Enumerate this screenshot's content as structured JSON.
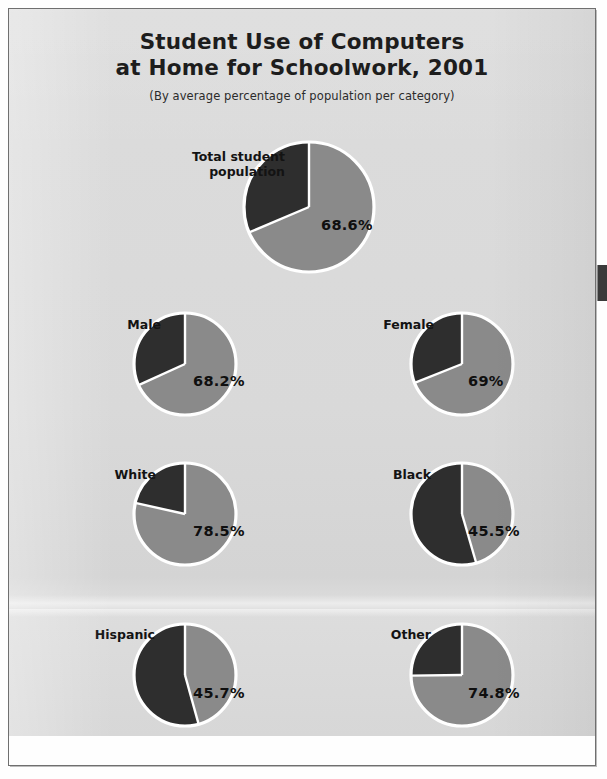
{
  "page": {
    "title_line1": "Student Use of Computers",
    "title_line2": "at Home for Schoolwork, 2001",
    "subtitle": "(By average percentage of population per category)"
  },
  "colors": {
    "panel_background": "#d9d9d9",
    "slice_value": "#8a8a8a",
    "slice_remainder": "#2e2e2e",
    "slice_outline": "#ffffff",
    "text": "#131313",
    "frame": "#6f6f6f"
  },
  "chart_data": {
    "type": "pie",
    "title": "Student Use of Computers at Home for Schoolwork, 2001",
    "subtitle": "(By average percentage of population per category)",
    "xlabel": "",
    "ylabel": "",
    "units": "percent",
    "legend_position": "none",
    "grid": false,
    "series_names": [
      "Uses computer at home for schoolwork",
      "Does not"
    ],
    "slice_colors": [
      "#8a8a8a",
      "#2e2e2e"
    ],
    "start_angle_deg": 0,
    "direction": "clockwise",
    "categories": [
      "Total student population",
      "Male",
      "Female",
      "White",
      "Black",
      "Hispanic",
      "Other"
    ],
    "values": [
      68.6,
      68.2,
      69,
      78.5,
      45.5,
      45.7,
      74.8
    ],
    "pies": [
      {
        "id": "total",
        "label": "Total student population",
        "label_lines": [
          "Total student",
          "population"
        ],
        "value": 68.6,
        "value_label": "68.6%",
        "remainder": 31.4
      },
      {
        "id": "male",
        "label": "Male",
        "label_lines": [
          "Male"
        ],
        "value": 68.2,
        "value_label": "68.2%",
        "remainder": 31.8
      },
      {
        "id": "female",
        "label": "Female",
        "label_lines": [
          "Female"
        ],
        "value": 69,
        "value_label": "69%",
        "remainder": 31
      },
      {
        "id": "white",
        "label": "White",
        "label_lines": [
          "White"
        ],
        "value": 78.5,
        "value_label": "78.5%",
        "remainder": 21.5
      },
      {
        "id": "black",
        "label": "Black",
        "label_lines": [
          "Black"
        ],
        "value": 45.5,
        "value_label": "45.5%",
        "remainder": 54.5
      },
      {
        "id": "hispanic",
        "label": "Hispanic",
        "label_lines": [
          "Hispanic"
        ],
        "value": 45.7,
        "value_label": "45.7%",
        "remainder": 54.3
      },
      {
        "id": "other",
        "label": "Other",
        "label_lines": [
          "Other"
        ],
        "value": 74.8,
        "value_label": "74.8%",
        "remainder": 25.2
      }
    ]
  },
  "layout": {
    "pies": [
      {
        "cx": 300,
        "cy": 198,
        "r": 65,
        "label_x": 158,
        "label_y": 140,
        "label_w": 118,
        "pct_x": 312,
        "pct_y": 208,
        "two_line": true,
        "pct_small": false
      },
      {
        "cx": 176,
        "cy": 355,
        "r": 51,
        "label_x": 60,
        "label_y": 308,
        "label_w": 92,
        "pct_x": 184,
        "pct_y": 364,
        "two_line": false,
        "pct_small": false
      },
      {
        "cx": 453,
        "cy": 355,
        "r": 51,
        "label_x": 333,
        "label_y": 308,
        "label_w": 92,
        "pct_x": 459,
        "pct_y": 364,
        "two_line": false,
        "pct_small": false
      },
      {
        "cx": 176,
        "cy": 505,
        "r": 51,
        "label_x": 55,
        "label_y": 458,
        "label_w": 92,
        "pct_x": 184,
        "pct_y": 514,
        "two_line": false,
        "pct_small": false
      },
      {
        "cx": 453,
        "cy": 505,
        "r": 51,
        "label_x": 330,
        "label_y": 458,
        "label_w": 92,
        "pct_x": 459,
        "pct_y": 514,
        "two_line": false,
        "pct_small": false
      },
      {
        "cx": 176,
        "cy": 666,
        "r": 51,
        "label_x": 42,
        "label_y": 618,
        "label_w": 104,
        "pct_x": 184,
        "pct_y": 676,
        "two_line": false,
        "pct_small": false
      },
      {
        "cx": 453,
        "cy": 666,
        "r": 51,
        "label_x": 330,
        "label_y": 618,
        "label_w": 92,
        "pct_x": 459,
        "pct_y": 676,
        "two_line": false,
        "pct_small": false
      }
    ]
  }
}
